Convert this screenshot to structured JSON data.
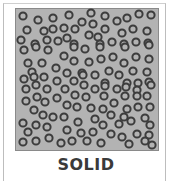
{
  "diagram": {
    "label": "SOLID",
    "colors": {
      "background": "#b3b3b3",
      "particle_ring": "#3c3c3c",
      "particle_center": "#b3b3b3",
      "label": "#3a3a3a"
    },
    "particles": [
      [
        23,
        16
      ],
      [
        38,
        20
      ],
      [
        53,
        18
      ],
      [
        69,
        15
      ],
      [
        82,
        22
      ],
      [
        91,
        13
      ],
      [
        93,
        24
      ],
      [
        105,
        16
      ],
      [
        117,
        21
      ],
      [
        127,
        18
      ],
      [
        139,
        14
      ],
      [
        151,
        15
      ],
      [
        27,
        30
      ],
      [
        44,
        31
      ],
      [
        53,
        29
      ],
      [
        64,
        28
      ],
      [
        75,
        29
      ],
      [
        89,
        35
      ],
      [
        98,
        37
      ],
      [
        105,
        29
      ],
      [
        122,
        33
      ],
      [
        133,
        29
      ],
      [
        147,
        31
      ],
      [
        21,
        40
      ],
      [
        35,
        44
      ],
      [
        47,
        40
      ],
      [
        58,
        41
      ],
      [
        67,
        38
      ],
      [
        74,
        44
      ],
      [
        100,
        44
      ],
      [
        112,
        42
      ],
      [
        124,
        44
      ],
      [
        136,
        42
      ],
      [
        148,
        43
      ],
      [
        24,
        50
      ],
      [
        36,
        47
      ],
      [
        48,
        50
      ],
      [
        74,
        47
      ],
      [
        85,
        49
      ],
      [
        100,
        47
      ],
      [
        125,
        47
      ],
      [
        149,
        45
      ],
      [
        28,
        63
      ],
      [
        42,
        63
      ],
      [
        64,
        56
      ],
      [
        74,
        61
      ],
      [
        89,
        62
      ],
      [
        101,
        59
      ],
      [
        113,
        57
      ],
      [
        124,
        63
      ],
      [
        136,
        57
      ],
      [
        149,
        59
      ],
      [
        32,
        72
      ],
      [
        56,
        68
      ],
      [
        67,
        73
      ],
      [
        82,
        73
      ],
      [
        95,
        75
      ],
      [
        109,
        71
      ],
      [
        119,
        75
      ],
      [
        133,
        71
      ],
      [
        147,
        72
      ],
      [
        24,
        79
      ],
      [
        44,
        77
      ],
      [
        34,
        77
      ],
      [
        57,
        81
      ],
      [
        74,
        81
      ],
      [
        83,
        75
      ],
      [
        105,
        83
      ],
      [
        127,
        83
      ],
      [
        138,
        83
      ],
      [
        149,
        82
      ],
      [
        26,
        89
      ],
      [
        36,
        85
      ],
      [
        47,
        89
      ],
      [
        65,
        89
      ],
      [
        84,
        85
      ],
      [
        95,
        89
      ],
      [
        105,
        86
      ],
      [
        117,
        89
      ],
      [
        126,
        87
      ],
      [
        137,
        90
      ],
      [
        151,
        85
      ],
      [
        26,
        101
      ],
      [
        37,
        97
      ],
      [
        45,
        102
      ],
      [
        57,
        98
      ],
      [
        67,
        105
      ],
      [
        75,
        95
      ],
      [
        86,
        97
      ],
      [
        104,
        96
      ],
      [
        114,
        103
      ],
      [
        125,
        96
      ],
      [
        137,
        96
      ],
      [
        147,
        96
      ],
      [
        34,
        110
      ],
      [
        77,
        107
      ],
      [
        91,
        108
      ],
      [
        103,
        109
      ],
      [
        127,
        109
      ],
      [
        138,
        107
      ],
      [
        150,
        107
      ],
      [
        43,
        115
      ],
      [
        53,
        117
      ],
      [
        64,
        117
      ],
      [
        111,
        115
      ],
      [
        124,
        117
      ],
      [
        23,
        123
      ],
      [
        36,
        125
      ],
      [
        47,
        127
      ],
      [
        78,
        122
      ],
      [
        95,
        119
      ],
      [
        103,
        125
      ],
      [
        119,
        124
      ],
      [
        131,
        121
      ],
      [
        145,
        118
      ],
      [
        150,
        125
      ],
      [
        28,
        132
      ],
      [
        67,
        130
      ],
      [
        81,
        133
      ],
      [
        93,
        132
      ],
      [
        111,
        134
      ],
      [
        122,
        137
      ],
      [
        137,
        134
      ],
      [
        149,
        135
      ],
      [
        23,
        142
      ],
      [
        36,
        141
      ],
      [
        49,
        138
      ],
      [
        61,
        143
      ],
      [
        72,
        141
      ],
      [
        87,
        141
      ],
      [
        101,
        143
      ],
      [
        129,
        144
      ],
      [
        145,
        141
      ],
      [
        152,
        145
      ]
    ]
  }
}
